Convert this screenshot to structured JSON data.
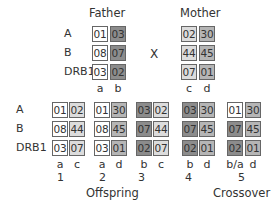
{
  "colors": {
    "a": "#ffffff",
    "b": "#8c8c8c",
    "c": "#dcdcdc",
    "d": "#b5b5b5",
    "border": "#666666",
    "text": "#333333"
  },
  "loci": [
    "A",
    "B",
    "DRB1"
  ],
  "cross_symbol": "X",
  "father": {
    "title": "Father",
    "haplotypes": [
      {
        "label": "a",
        "alleles": [
          "01",
          "08",
          "03"
        ]
      },
      {
        "label": "b",
        "alleles": [
          "03",
          "07",
          "02"
        ]
      }
    ]
  },
  "mother": {
    "title": "Mother",
    "haplotypes": [
      {
        "label": "c",
        "alleles": [
          "02",
          "44",
          "07"
        ]
      },
      {
        "label": "d",
        "alleles": [
          "30",
          "45",
          "01"
        ]
      }
    ]
  },
  "offspring": {
    "title": "Offspring",
    "children": [
      {
        "number": "1",
        "haplotypes": [
          {
            "label": "a",
            "alleles": [
              "01",
              "08",
              "03"
            ]
          },
          {
            "label": "c",
            "alleles": [
              "02",
              "44",
              "07"
            ]
          }
        ]
      },
      {
        "number": "2",
        "haplotypes": [
          {
            "label": "a",
            "alleles": [
              "01",
              "08",
              "03"
            ]
          },
          {
            "label": "d",
            "alleles": [
              "30",
              "45",
              "01"
            ]
          }
        ]
      },
      {
        "number": "3",
        "haplotypes": [
          {
            "label": "b",
            "alleles": [
              "03",
              "07",
              "02"
            ]
          },
          {
            "label": "c",
            "alleles": [
              "02",
              "44",
              "07"
            ]
          }
        ]
      },
      {
        "number": "4",
        "haplotypes": [
          {
            "label": "b",
            "alleles": [
              "03",
              "07",
              "02"
            ]
          },
          {
            "label": "d",
            "alleles": [
              "30",
              "45",
              "01"
            ]
          }
        ]
      },
      {
        "number": "5",
        "haplotypes": [
          {
            "label": "b/a",
            "alleles": [
              "01",
              "07",
              "02"
            ]
          },
          {
            "label": "d",
            "alleles": [
              "30",
              "45",
              "01"
            ]
          }
        ]
      }
    ]
  },
  "crossover_label": "Crossover"
}
